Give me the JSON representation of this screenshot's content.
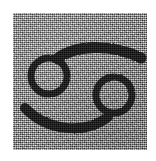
{
  "image": {
    "kind": "scanned-symbol-tile",
    "width": 156,
    "height": 161,
    "background_color": "#ffffff",
    "alt_text": "Cancer zodiac symbol"
  },
  "plate": {
    "label": "grainy gray background tile",
    "fill_color": "#9c9c9c",
    "texture": "film-grain noise",
    "left": 13,
    "top": 13,
    "width": 134,
    "height": 137
  },
  "symbol": {
    "name": "Cancer",
    "glyph": "♋",
    "ink_color": "#111111",
    "stroke_width": 7,
    "parts": [
      {
        "name": "upper-ring",
        "cx": 49,
        "cy": 76,
        "r": 19
      },
      {
        "name": "lower-ring",
        "cx": 114,
        "cy": 95,
        "r": 19
      },
      {
        "name": "upper-arc",
        "from_x": 57,
        "from_y": 58,
        "to_x": 141,
        "to_y": 58
      },
      {
        "name": "lower-arc",
        "from_x": 25,
        "from_y": 108,
        "to_x": 107,
        "to_y": 110
      }
    ]
  }
}
